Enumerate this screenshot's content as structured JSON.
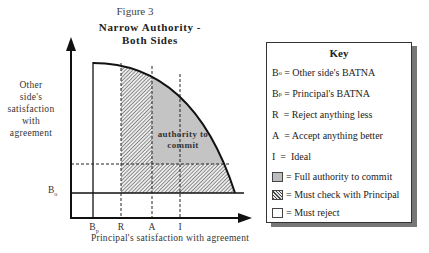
{
  "figure": {
    "label": "Figure 3",
    "title_line1": "Narrow Authority -",
    "title_line2": "Both Sides"
  },
  "axes": {
    "y_label_lines": [
      "Other",
      "side's",
      "satisfaction",
      "with",
      "agreement"
    ],
    "x_label": "Principal's satisfaction with agreement",
    "y_tick": {
      "base": "B",
      "sub": "o"
    },
    "x_ticks": [
      {
        "base": "B",
        "sub": "p"
      },
      {
        "base": "R",
        "sub": ""
      },
      {
        "base": "A",
        "sub": ""
      },
      {
        "base": "I",
        "sub": ""
      }
    ]
  },
  "regions": {
    "authority_label_line1": "authority to",
    "authority_label_line2": "commit"
  },
  "key": {
    "title": "Key",
    "items": [
      {
        "sym": "B",
        "sub": "o",
        "text": " = Other side's BATNA"
      },
      {
        "sym": "B",
        "sub": "p",
        "text": " = Principal's BATNA"
      },
      {
        "sym": "R",
        "sub": "",
        "text": "  = Reject anything less"
      },
      {
        "sym": "A",
        "sub": "",
        "text": "  = Accept anything better"
      },
      {
        "sym": "I",
        "sub": "",
        "text": "  =  Ideal"
      }
    ],
    "swatches": [
      {
        "style": "full",
        "text": "= Full authority to commit"
      },
      {
        "style": "check",
        "text": "= Must check with Principal"
      },
      {
        "style": "reject",
        "text": "= Must reject"
      }
    ]
  },
  "colors": {
    "full_authority": "#bdbdbd",
    "hatch": "#444444",
    "axis": "#111111",
    "shadow": "#777777"
  }
}
